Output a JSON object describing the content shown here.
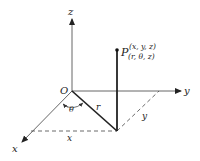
{
  "diagram": {
    "type": "cylindrical-coordinates",
    "axes": {
      "x_label": "x",
      "y_label": "y",
      "z_label": "z"
    },
    "origin_label": "O",
    "point": {
      "name": "P",
      "cartesian": "(x, y, z)",
      "cylindrical": "(r, θ, z)"
    },
    "segments": {
      "radius_label": "r",
      "angle_label": "θ",
      "x_projection_label": "x",
      "y_projection_label": "y"
    },
    "colors": {
      "line": "#333333",
      "axis": "#555555",
      "text": "#222222"
    }
  }
}
